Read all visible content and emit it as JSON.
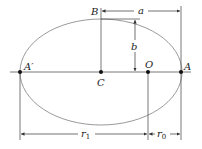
{
  "diagram": {
    "type": "ellipse-orbit-geometry",
    "colors": {
      "ellipse": "#9a9a9a",
      "line": "#444444",
      "point": "#111111",
      "text": "#222222"
    },
    "points": {
      "A_prime": {
        "label": "A′"
      },
      "A": {
        "label": "A"
      },
      "B": {
        "label": "B"
      },
      "C": {
        "label": "C"
      },
      "O": {
        "label": "O"
      }
    },
    "dimensions": {
      "a": {
        "label": "a"
      },
      "b": {
        "label": "b"
      },
      "r1": {
        "label": "r",
        "sub": "1"
      },
      "r0": {
        "label": "r",
        "sub": "0"
      }
    }
  }
}
